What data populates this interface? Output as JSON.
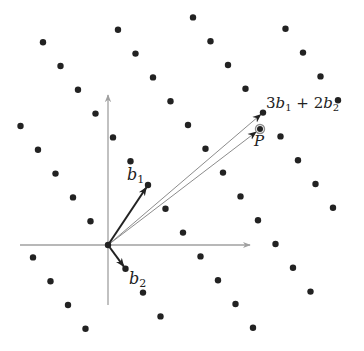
{
  "diagram": {
    "type": "lattice",
    "colors": {
      "background": "#ffffff",
      "lattice_point": "#222222",
      "axis": "#a0a0a0",
      "basis_vector": "#222222",
      "long_vector": "#8c8c8c",
      "target_ring": "#8c8c8c"
    },
    "origin_px": [
      108,
      245
    ],
    "basis_px": {
      "b1": [
        40,
        -60
      ],
      "b2": [
        17.5,
        23.8
      ]
    },
    "axes": {
      "x": {
        "from": [
          20,
          245
        ],
        "to": [
          250,
          245
        ]
      },
      "y": {
        "from": [
          108,
          305
        ],
        "to": [
          108,
          95
        ]
      }
    },
    "lattice_points": [
      {
        "a": -1,
        "b": -2
      },
      {
        "a": -1,
        "b": -1
      },
      {
        "a": -1,
        "b": 0
      },
      {
        "a": -1,
        "b": 1
      },
      {
        "a": 0,
        "b": -5
      },
      {
        "a": 0,
        "b": -4
      },
      {
        "a": 0,
        "b": -3
      },
      {
        "a": 0,
        "b": -2
      },
      {
        "a": 0,
        "b": -1
      },
      {
        "a": 0,
        "b": 0
      },
      {
        "a": 0,
        "b": 1
      },
      {
        "a": 0,
        "b": 2
      },
      {
        "a": 0,
        "b": 3
      },
      {
        "a": 1,
        "b": -6
      },
      {
        "a": 1,
        "b": -5
      },
      {
        "a": 1,
        "b": -4
      },
      {
        "a": 1,
        "b": -3
      },
      {
        "a": 1,
        "b": -2
      },
      {
        "a": 1,
        "b": -1
      },
      {
        "a": 1,
        "b": 0
      },
      {
        "a": 1,
        "b": 1
      },
      {
        "a": 1,
        "b": 2
      },
      {
        "a": 1,
        "b": 3
      },
      {
        "a": 1,
        "b": 4
      },
      {
        "a": 1,
        "b": 5
      },
      {
        "a": 1,
        "b": 6
      },
      {
        "a": 2,
        "b": -4
      },
      {
        "a": 2,
        "b": -3
      },
      {
        "a": 2,
        "b": -2
      },
      {
        "a": 2,
        "b": -1
      },
      {
        "a": 2,
        "b": 0
      },
      {
        "a": 2,
        "b": 1
      },
      {
        "a": 2,
        "b": 2
      },
      {
        "a": 2,
        "b": 3
      },
      {
        "a": 2,
        "b": 4
      },
      {
        "a": 2,
        "b": 5
      },
      {
        "a": 2,
        "b": 6
      },
      {
        "a": 2,
        "b": 7
      },
      {
        "a": 3,
        "b": -2
      },
      {
        "a": 3,
        "b": -1
      },
      {
        "a": 3,
        "b": 0
      },
      {
        "a": 3,
        "b": 1
      },
      {
        "a": 3,
        "b": 2
      },
      {
        "a": 3,
        "b": 3
      },
      {
        "a": 3,
        "b": 4
      },
      {
        "a": 3,
        "b": 5
      },
      {
        "a": 3,
        "b": 6
      },
      {
        "a": 4,
        "b": 1
      },
      {
        "a": 4,
        "b": 2
      },
      {
        "a": 4,
        "b": 3
      },
      {
        "a": 4,
        "b": 4
      }
    ],
    "target_point": {
      "px": [
        260,
        129
      ]
    },
    "labels": {
      "b1": {
        "base": "b",
        "sub": "1"
      },
      "b2": {
        "base": "b",
        "sub": "2"
      },
      "combo": {
        "c1": "3",
        "v1": "b",
        "s1": "1",
        "op": " + ",
        "c2": "2",
        "v2": "b",
        "s2": "2"
      },
      "P": "P"
    }
  }
}
